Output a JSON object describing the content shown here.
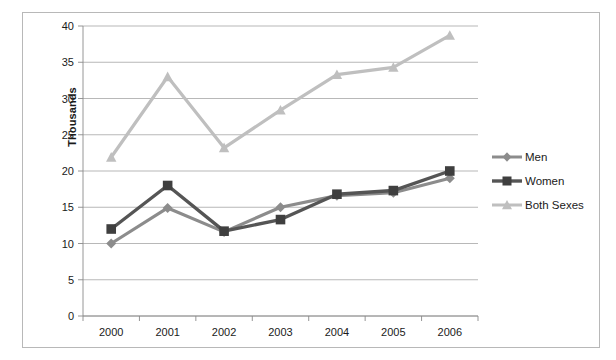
{
  "chart_data": {
    "type": "line",
    "title": "",
    "subtitle": "",
    "xlabel": "",
    "ylabel": "Thousands",
    "categories": [
      "2000",
      "2001",
      "2002",
      "2003",
      "2004",
      "2005",
      "2006"
    ],
    "series": [
      {
        "name": "Men",
        "color": "#8c8c8c",
        "marker": "diamond",
        "values": [
          10.0,
          14.9,
          11.6,
          15.0,
          16.6,
          17.0,
          19.0
        ]
      },
      {
        "name": "Women",
        "color": "#555555",
        "marker": "square",
        "values": [
          12.0,
          18.0,
          11.7,
          13.3,
          16.8,
          17.3,
          20.0
        ]
      },
      {
        "name": "Both Sexes",
        "color": "#bfbfbf",
        "marker": "triangle",
        "values": [
          21.9,
          33.0,
          23.2,
          28.4,
          33.3,
          34.3,
          38.7
        ]
      }
    ],
    "ylim": [
      0,
      40
    ],
    "ytick_step": 5,
    "yticks": [
      "0",
      "5",
      "10",
      "15",
      "20",
      "25",
      "30",
      "35",
      "40"
    ],
    "grid": "horizontal",
    "legend_position": "right",
    "legend_entries": [
      "Men",
      "Women",
      "Both Sexes"
    ],
    "annotations": []
  },
  "axes": {
    "y_title": "Thousands"
  },
  "colors": {
    "men": "#8c8c8c",
    "women": "#555555",
    "both_sexes": "#bfbfbf",
    "grid": "#9a9a9a",
    "frame": "#b8b8b8",
    "text": "#1a1a1a"
  }
}
